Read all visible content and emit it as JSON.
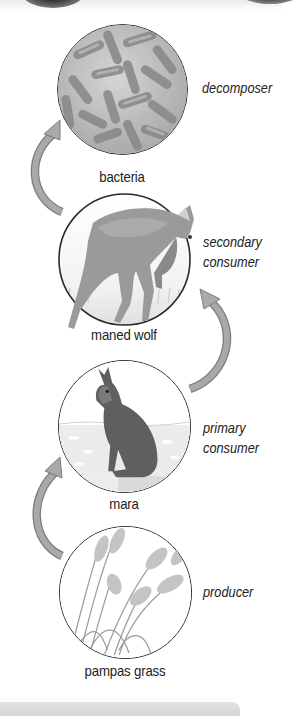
{
  "diagram": {
    "type": "food-chain",
    "nodes": [
      {
        "name": "bacteria",
        "role": "decomposer"
      },
      {
        "name": "maned wolf",
        "role_line1": "secondary",
        "role_line2": "consumer"
      },
      {
        "name": "mara",
        "role_line1": "primary",
        "role_line2": "consumer"
      },
      {
        "name": "pampas grass",
        "role": "producer"
      }
    ],
    "arrows": [
      {
        "from": "pampas grass",
        "to": "mara"
      },
      {
        "from": "mara",
        "to": "maned wolf"
      },
      {
        "from": "maned wolf",
        "to": "bacteria"
      }
    ]
  },
  "colors": {
    "arrow_fill": "#a9a9a9",
    "arrow_stroke": "#7d7d7d",
    "circle_border": "#2a2a2a",
    "text": "#222222"
  }
}
